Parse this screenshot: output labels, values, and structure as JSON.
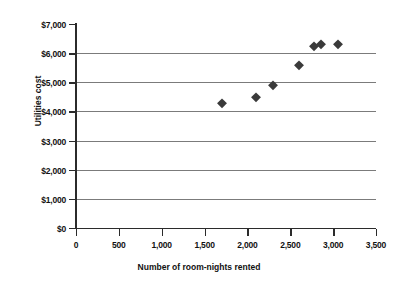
{
  "chart_data": {
    "type": "scatter",
    "title": "",
    "xlabel": "Number of room-nights rented",
    "ylabel": "Utilities cost",
    "xlim": [
      0,
      3500
    ],
    "ylim": [
      0,
      7000
    ],
    "grid": "horizontal",
    "legend": "none",
    "marker": "diamond",
    "marker_color": "#3a3a3a",
    "x_tick_labels": [
      "0",
      "500",
      "1,000",
      "1,500",
      "2,000",
      "2,500",
      "3,000",
      "3,500"
    ],
    "x_tick_values": [
      0,
      500,
      1000,
      1500,
      2000,
      2500,
      3000,
      3500
    ],
    "y_tick_labels": [
      "$0",
      "$1,000",
      "$2,000",
      "$3,000",
      "$4,000",
      "$5,000",
      "$6,000",
      "$7,000"
    ],
    "y_tick_values": [
      0,
      1000,
      2000,
      3000,
      4000,
      5000,
      6000,
      7000
    ],
    "points": [
      {
        "x": 1700,
        "y": 4300
      },
      {
        "x": 2100,
        "y": 4500
      },
      {
        "x": 2300,
        "y": 4900
      },
      {
        "x": 2600,
        "y": 5600
      },
      {
        "x": 2780,
        "y": 6250
      },
      {
        "x": 2860,
        "y": 6300
      },
      {
        "x": 3060,
        "y": 6300
      }
    ],
    "series": [
      {
        "name": "Utilities cost vs room-nights",
        "x": [
          1700,
          2100,
          2300,
          2600,
          2780,
          2860,
          3060
        ],
        "values": [
          4300,
          4500,
          4900,
          5600,
          6250,
          6300,
          6300
        ]
      }
    ]
  }
}
